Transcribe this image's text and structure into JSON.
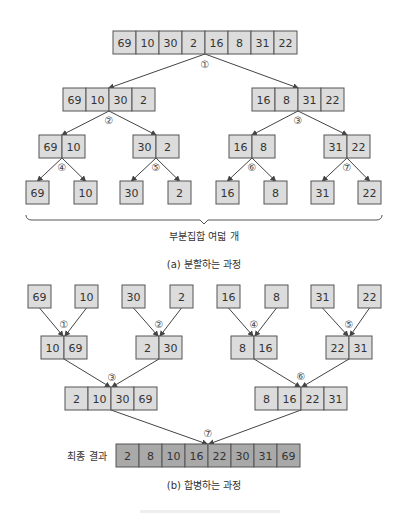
{
  "diagram": {
    "type": "merge-sort",
    "split": {
      "caption": "(a) 분할하는 과정",
      "brace_label": "부분집합 여덟 개",
      "root": [
        69,
        10,
        30,
        2,
        16,
        8,
        31,
        22
      ],
      "level1": [
        [
          69,
          10,
          30,
          2
        ],
        [
          16,
          8,
          31,
          22
        ]
      ],
      "level2": [
        [
          69,
          10
        ],
        [
          30,
          2
        ],
        [
          16,
          8
        ],
        [
          31,
          22
        ]
      ],
      "leaves": [
        69,
        10,
        30,
        2,
        16,
        8,
        31,
        22
      ],
      "steps": [
        "①",
        "②",
        "③",
        "④",
        "⑤",
        "⑥",
        "⑦"
      ]
    },
    "merge": {
      "caption": "(b) 합병하는 과정",
      "final_label": "최종 결과",
      "leaves": [
        69,
        10,
        30,
        2,
        16,
        8,
        31,
        22
      ],
      "level1": [
        [
          10,
          69
        ],
        [
          2,
          30
        ],
        [
          8,
          16
        ],
        [
          22,
          31
        ]
      ],
      "level2": [
        [
          2,
          10,
          30,
          69
        ],
        [
          8,
          16,
          22,
          31
        ]
      ],
      "final": [
        2,
        8,
        10,
        16,
        22,
        30,
        31,
        69
      ],
      "steps": [
        "①",
        "②",
        "③",
        "④",
        "⑤",
        "⑥",
        "⑦"
      ]
    },
    "colors": {
      "cell": "#dcdcdc",
      "final_cell": "#a9a9a9",
      "stroke": "#555555"
    }
  }
}
